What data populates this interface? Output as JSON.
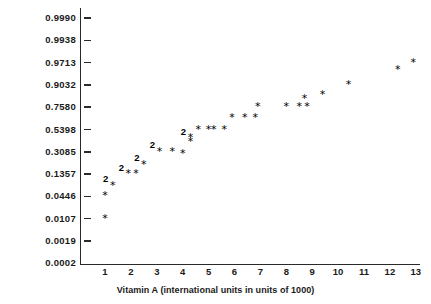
{
  "chart_data": {
    "type": "scatter",
    "title": "",
    "subtitle": "",
    "xlabel": "Vitamin A (international units in units of 1000)",
    "ylabel": "Cumulative Probabilities",
    "grid": false,
    "legend": null,
    "xlim": [
      0.6,
      13.6
    ],
    "ylim_labels_evenly_spaced": true,
    "note": "Normal probability plot. Y axis uses evenly spaced normal-score positions labeled with cumulative probabilities. A '2' plotted above a star means two observations coincide at that location.",
    "xticks": [
      1,
      2,
      3,
      4,
      5,
      6,
      7,
      8,
      9,
      10,
      11,
      12,
      13
    ],
    "ytick_labels": [
      "0.9990",
      "0.9938",
      "0.9713",
      "0.9032",
      "0.7580",
      "0.5398",
      "0.3085",
      "0.1357",
      "0.0446",
      "0.0107",
      "0.0019",
      "0.0002"
    ],
    "ytick_values": [
      0.999,
      0.9938,
      0.9713,
      0.9032,
      0.758,
      0.5398,
      0.3085,
      0.1357,
      0.0446,
      0.0107,
      0.0019,
      0.0002
    ],
    "ytick_has_mark": [
      true,
      true,
      true,
      true,
      true,
      true,
      true,
      true,
      true,
      true,
      true,
      false
    ],
    "marker_symbol": "*",
    "duplicate_symbol": "2",
    "points": [
      {
        "x": 1.0,
        "p": 0.0107,
        "count": 1
      },
      {
        "x": 1.0,
        "p": 0.0446,
        "count": 1
      },
      {
        "x": 1.3,
        "p": 0.089,
        "count": 2
      },
      {
        "x": 1.9,
        "p": 0.1357,
        "count": 2
      },
      {
        "x": 2.2,
        "p": 0.1357,
        "count": 1
      },
      {
        "x": 2.5,
        "p": 0.21,
        "count": 2
      },
      {
        "x": 3.1,
        "p": 0.3085,
        "count": 2
      },
      {
        "x": 3.6,
        "p": 0.3085,
        "count": 1
      },
      {
        "x": 4.0,
        "p": 0.29,
        "count": 1
      },
      {
        "x": 4.3,
        "p": 0.45,
        "count": 2
      },
      {
        "x": 4.3,
        "p": 0.41,
        "count": 1
      },
      {
        "x": 4.6,
        "p": 0.5398,
        "count": 1
      },
      {
        "x": 5.0,
        "p": 0.5398,
        "count": 1
      },
      {
        "x": 5.2,
        "p": 0.5398,
        "count": 1
      },
      {
        "x": 5.6,
        "p": 0.5398,
        "count": 1
      },
      {
        "x": 5.9,
        "p": 0.65,
        "count": 1
      },
      {
        "x": 6.4,
        "p": 0.65,
        "count": 1
      },
      {
        "x": 6.8,
        "p": 0.65,
        "count": 1
      },
      {
        "x": 6.9,
        "p": 0.758,
        "count": 1
      },
      {
        "x": 8.0,
        "p": 0.758,
        "count": 1
      },
      {
        "x": 8.5,
        "p": 0.758,
        "count": 1
      },
      {
        "x": 8.8,
        "p": 0.758,
        "count": 1
      },
      {
        "x": 8.7,
        "p": 0.81,
        "count": 1
      },
      {
        "x": 9.4,
        "p": 0.84,
        "count": 1
      },
      {
        "x": 10.4,
        "p": 0.9032,
        "count": 1
      },
      {
        "x": 12.3,
        "p": 0.95,
        "count": 1
      },
      {
        "x": 12.9,
        "p": 0.9713,
        "count": 1
      }
    ]
  }
}
